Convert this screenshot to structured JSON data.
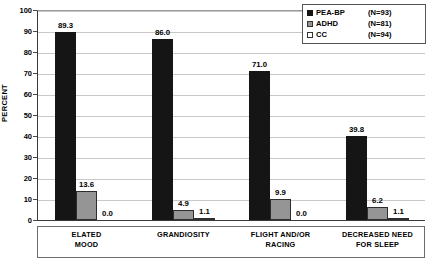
{
  "chart_data": {
    "type": "bar",
    "title": "",
    "xlabel": "",
    "ylabel": "PERCENT",
    "ylim": [
      0,
      100
    ],
    "ytick_step": 10,
    "yticks": [
      "100",
      "90",
      "80",
      "70",
      "60",
      "50",
      "40",
      "30",
      "20",
      "10",
      "0"
    ],
    "grid": true,
    "legend_position": "top-right",
    "categories": [
      "ELATED\nMOOD",
      "GRANDIOSITY",
      "FLIGHT AND/OR\nRACING",
      "DECREASED NEED\nFOR SLEEP"
    ],
    "series": [
      {
        "name": "PEA-BP",
        "n_label": "(N=93)",
        "color": "#151515",
        "values": [
          89.3,
          86.0,
          71.0,
          39.8
        ],
        "labels": [
          "89.3",
          "86.0",
          "71.0",
          "39.8"
        ]
      },
      {
        "name": "ADHD",
        "n_label": "(N=81)",
        "color": "#959595",
        "values": [
          13.6,
          4.9,
          9.9,
          6.2
        ],
        "labels": [
          "13.6",
          "4.9",
          "9.9",
          "6.2"
        ]
      },
      {
        "name": "CC",
        "n_label": "(N=94)",
        "color": "#ffffff",
        "values": [
          0.0,
          1.1,
          0.0,
          1.1
        ],
        "labels": [
          "0.0",
          "1.1",
          "0.0",
          "1.1"
        ]
      }
    ]
  }
}
